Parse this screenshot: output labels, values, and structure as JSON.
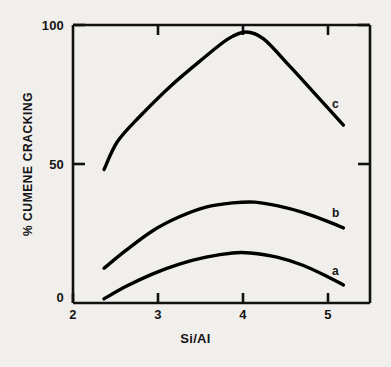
{
  "chart_data": {
    "type": "line",
    "title": "",
    "xlabel": "Si/Al",
    "ylabel": "% CUMENE CRACKING",
    "xlim": [
      2,
      5.35
    ],
    "ylim": [
      0,
      100
    ],
    "xticks": [
      2,
      3,
      4,
      5
    ],
    "xtick_labels": [
      "2",
      "3",
      "4",
      "5"
    ],
    "yticks": [
      0,
      50,
      100
    ],
    "ytick_labels": [
      "0",
      "50",
      "100"
    ],
    "grid": false,
    "legend_position": "inline-right-curve-end",
    "series": [
      {
        "name": "a",
        "label": "a",
        "color": "#000000",
        "x": [
          2.35,
          2.6,
          2.9,
          3.2,
          3.5,
          3.8,
          4.0,
          4.3,
          4.6,
          4.9,
          5.05
        ],
        "y": [
          1.5,
          6.0,
          10.5,
          14.0,
          16.5,
          18.0,
          18.0,
          16.5,
          13.5,
          9.0,
          6.5
        ]
      },
      {
        "name": "b",
        "label": "b",
        "color": "#000000",
        "x": [
          2.35,
          2.6,
          2.9,
          3.2,
          3.5,
          3.8,
          4.05,
          4.3,
          4.6,
          4.9,
          5.05
        ],
        "y": [
          12.5,
          19.0,
          26.0,
          31.0,
          34.5,
          36.0,
          36.3,
          35.0,
          32.5,
          29.0,
          27.0
        ]
      },
      {
        "name": "c",
        "label": "c",
        "color": "#000000",
        "x": [
          2.35,
          2.5,
          2.75,
          3.1,
          3.45,
          3.75,
          3.95,
          4.15,
          4.45,
          4.75,
          5.05
        ],
        "y": [
          48.0,
          58.0,
          67.0,
          78.0,
          87.5,
          95.0,
          97.5,
          95.0,
          85.0,
          74.5,
          64.0
        ]
      }
    ]
  },
  "axis": {
    "y_title": "% CUMENE CRACKING",
    "x_title": "Si/Al",
    "y_tick_0": "0",
    "y_tick_1": "50",
    "y_tick_2": "100",
    "x_tick_0": "2",
    "x_tick_1": "3",
    "x_tick_2": "4",
    "x_tick_3": "5"
  },
  "curve_labels": {
    "a": "a",
    "b": "b",
    "c": "c"
  }
}
